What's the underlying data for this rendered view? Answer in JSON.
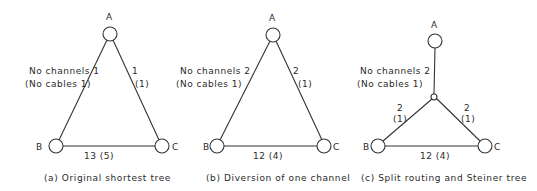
{
  "panels": [
    {
      "id": "a",
      "caption": "(a) Original shortest tree",
      "nodes": {
        "A": "A",
        "B": "B",
        "C": "C"
      },
      "edge_AB": {
        "channels": "No channels 1",
        "cables": "(No cables 1)"
      },
      "edge_AC": {
        "channels": "1",
        "cables": "(1)"
      },
      "edge_BC": "13 (5)"
    },
    {
      "id": "b",
      "caption": "(b) Diversion of one channel",
      "nodes": {
        "A": "A",
        "B": "B",
        "C": "C"
      },
      "edge_AB": {
        "channels": "No channels 2",
        "cables": "(No cables 1)"
      },
      "edge_AC": {
        "channels": "2",
        "cables": "(1)"
      },
      "edge_BC": "12 (4)"
    },
    {
      "id": "c",
      "caption": "(c) Split routing and Steiner tree",
      "nodes": {
        "A": "A",
        "B": "B",
        "C": "C"
      },
      "edge_A_steiner": {
        "channels": "No channels 2",
        "cables": "(No cables 1)"
      },
      "edge_steiner_B": {
        "channels": "2",
        "cables": "(1)"
      },
      "edge_steiner_C": {
        "channels": "2",
        "cables": "(1)"
      },
      "edge_BC": "12 (4)"
    }
  ]
}
